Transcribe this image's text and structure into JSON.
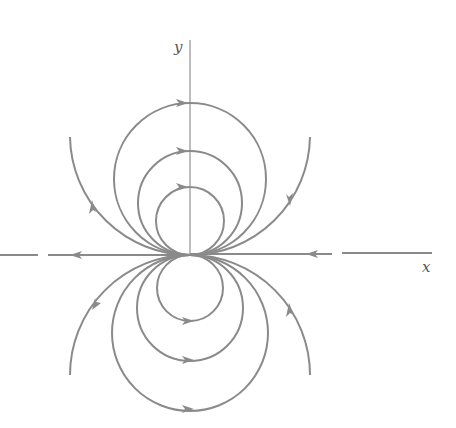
{
  "diagram": {
    "type": "phase-portrait",
    "axes": {
      "x_label": "x",
      "y_label": "y"
    },
    "colors": {
      "curve": "#8a8a8a",
      "axis": "#9a9a9a",
      "background": "#ffffff"
    },
    "origin_px": [
      190,
      255
    ],
    "upper_circles_radius_px": [
      34,
      52,
      76,
      120
    ],
    "lower_circles_radius_px": [
      33,
      53,
      78,
      120
    ],
    "flow_direction": {
      "upper_circles": "clockwise (rightward at top)",
      "lower_circles": "counterclockwise (rightward at bottom)",
      "x_axis_negative": "leftward away from origin",
      "x_axis_positive": "leftward toward origin"
    }
  }
}
